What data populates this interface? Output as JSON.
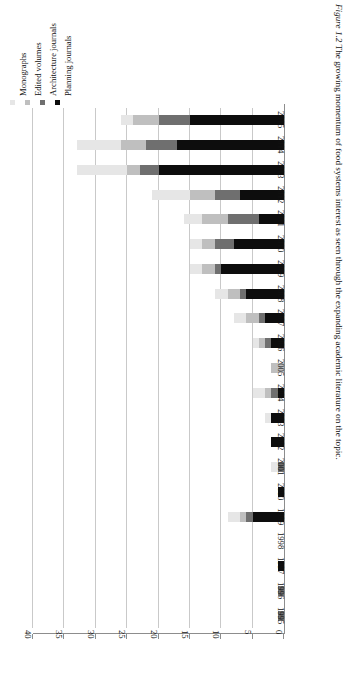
{
  "figure": {
    "caption_label": "Figure 1.2",
    "caption_text": "The growing momentum of food systems interest as seen through the expanding academic literature on the topic."
  },
  "legend": {
    "position": "top-left",
    "items": [
      {
        "label": "Monographs",
        "color": "#e6e6e6",
        "key": "monographs"
      },
      {
        "label": "Edited volumes",
        "color": "#bfbfbf",
        "key": "edited"
      },
      {
        "label": "Architecture journals",
        "color": "#6f6f6f",
        "key": "architecture"
      },
      {
        "label": "Planning journals",
        "color": "#0d0d0d",
        "key": "planning"
      }
    ]
  },
  "axis": {
    "value_ticks": [
      "0",
      "5",
      "10",
      "15",
      "20",
      "25",
      "30",
      "35",
      "40"
    ],
    "value_min": 0,
    "value_max": 40,
    "value_step": 5
  },
  "chart_data": {
    "type": "bar",
    "orientation": "horizontal-rotated",
    "title": "",
    "subtitle": "",
    "xlabel": "",
    "ylabel": "",
    "ylim": [
      0,
      40
    ],
    "grid": true,
    "legend_position": "top-left",
    "stacked": true,
    "categories": [
      "1995",
      "1996",
      "1997",
      "1998",
      "1999",
      "2000",
      "2001",
      "2002",
      "2003",
      "2004",
      "2005",
      "2006",
      "2007",
      "2008",
      "2009",
      "2010",
      "2011",
      "2012",
      "2013",
      "2014",
      "2015"
    ],
    "series": [
      {
        "name": "Planning journals",
        "color": "#0d0d0d",
        "values": [
          0,
          0,
          1,
          0,
          5,
          1,
          0,
          2,
          2,
          1,
          0,
          2,
          3,
          6,
          10,
          8,
          4,
          7,
          20,
          17,
          15
        ]
      },
      {
        "name": "Architecture journals",
        "color": "#6f6f6f",
        "values": [
          1,
          1,
          0,
          0,
          1,
          0,
          1,
          0,
          0,
          1,
          0,
          1,
          1,
          1,
          1,
          3,
          5,
          4,
          3,
          5,
          5
        ]
      },
      {
        "name": "Edited volumes",
        "color": "#bfbfbf",
        "values": [
          0,
          0,
          0,
          0,
          1,
          0,
          0,
          0,
          0,
          1,
          2,
          1,
          2,
          2,
          2,
          2,
          4,
          4,
          2,
          4,
          4
        ]
      },
      {
        "name": "Monographs",
        "color": "#e6e6e6",
        "values": [
          0,
          0,
          0,
          0,
          2,
          0,
          1,
          0,
          1,
          2,
          0,
          1,
          2,
          2,
          2,
          2,
          3,
          6,
          8,
          7,
          2
        ]
      }
    ],
    "totals": [
      1,
      1,
      1,
      0,
      9,
      1,
      2,
      2,
      3,
      5,
      2,
      5,
      8,
      11,
      15,
      15,
      16,
      21,
      33,
      33,
      26
    ]
  }
}
